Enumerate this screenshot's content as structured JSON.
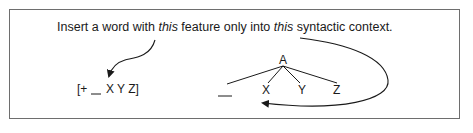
{
  "instruction": {
    "part1": "Insert a word with ",
    "em1": "this",
    "part2": " feature only into ",
    "em2": "this",
    "part3": " syntactic context."
  },
  "feature_frame": {
    "open": "[+",
    "slot": "__",
    "rest": "X Y Z]"
  },
  "tree": {
    "root": "A",
    "children": [
      "__",
      "X",
      "Y",
      "Z"
    ]
  },
  "colors": {
    "ink": "#1a1a1a",
    "border": "#6e6e6e"
  }
}
